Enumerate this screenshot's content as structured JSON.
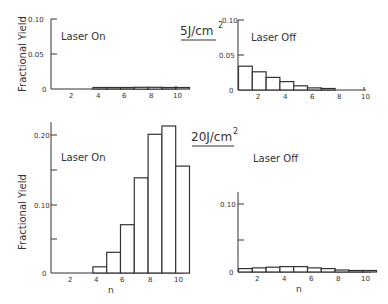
{
  "figure": {
    "ylabel": "Fractional Yield",
    "xlabel": "n"
  },
  "chart_data": [
    {
      "type": "bar",
      "panel": "top-left",
      "fluence": "5J/cm2",
      "title": "Laser On",
      "xlabel": "",
      "ylabel": "Fractional Yield",
      "categories": [
        1,
        2,
        3,
        4,
        5,
        6,
        7,
        8,
        9,
        10
      ],
      "values": [
        0,
        0,
        0,
        0.001,
        0.0015,
        0.002,
        0.0025,
        0.0025,
        0.0015,
        0.001
      ],
      "ylim": [
        0,
        0.1
      ],
      "yticks": [
        "0",
        "0.05",
        "0.10"
      ],
      "xticks": [
        "2",
        "4",
        "6",
        "8",
        "10"
      ]
    },
    {
      "type": "bar",
      "panel": "top-right",
      "fluence": "5J/cm2",
      "title": "Laser Off",
      "xlabel": "",
      "ylabel": "",
      "categories": [
        1,
        2,
        3,
        4,
        5,
        6,
        7,
        8,
        9,
        10
      ],
      "values": [
        0.034,
        0.026,
        0.018,
        0.012,
        0.006,
        0.003,
        0.0015,
        0,
        0,
        0
      ],
      "ylim": [
        0,
        0.1
      ],
      "yticks": [
        "0",
        "0.05",
        "0.10"
      ],
      "xticks": [
        "2",
        "4",
        "6",
        "8",
        "10"
      ]
    },
    {
      "type": "bar",
      "panel": "bottom-left",
      "fluence": "20J/cm2",
      "title": "Laser On",
      "xlabel": "n",
      "ylabel": "Fractional Yield",
      "categories": [
        1,
        2,
        3,
        4,
        5,
        6,
        7,
        8,
        9,
        10
      ],
      "values": [
        0,
        0,
        0,
        0.009,
        0.03,
        0.07,
        0.138,
        0.201,
        0.213,
        0.155
      ],
      "ylim": [
        0,
        0.22
      ],
      "yticks": [
        "0",
        "0.10",
        "0.20"
      ],
      "xticks": [
        "2",
        "4",
        "6",
        "8",
        "10"
      ]
    },
    {
      "type": "bar",
      "panel": "bottom-right",
      "fluence": "20J/cm2",
      "title": "Laser Off",
      "xlabel": "n",
      "ylabel": "",
      "categories": [
        1,
        2,
        3,
        4,
        5,
        6,
        7,
        8,
        9,
        10
      ],
      "values": [
        0.005,
        0.006,
        0.007,
        0.008,
        0.008,
        0.006,
        0.005,
        0.003,
        0.002,
        0.001
      ],
      "ylim": [
        0,
        0.12
      ],
      "yticks": [
        "0",
        "0.10"
      ],
      "xticks": [
        "2",
        "4",
        "6",
        "8",
        "10"
      ]
    }
  ],
  "labels": {
    "fluence_top": "5J/cm",
    "fluence_bottom": "20J/cm",
    "sup": "2",
    "tl_title": "Laser On",
    "tr_title": "Laser Off",
    "bl_title": "Laser On",
    "br_title": "Laser Off",
    "ylabel": "Fractional Yield",
    "xlabel": "n",
    "t0": "0",
    "t005": "0.05",
    "t010": "0.10",
    "t020": "0.20",
    "x2": "2",
    "x4": "4",
    "x6": "6",
    "x8": "8",
    "x10": "10"
  }
}
